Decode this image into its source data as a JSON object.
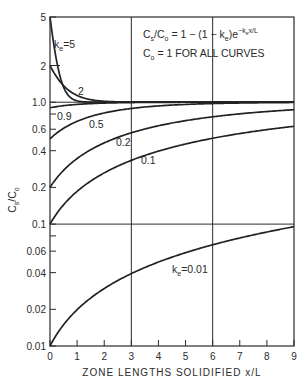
{
  "chart_data": {
    "type": "line",
    "title": "",
    "equation": "Cs/C0 = 1 - (1 - ke) e^(-ke x/L)",
    "note": "C0 = 1 FOR ALL CURVES",
    "xlabel": "ZONE LENGTHS SOLIDIFIED x/L",
    "ylabel": "Cs/C0",
    "xlim": [
      0,
      9
    ],
    "ylim": [
      0.01,
      5
    ],
    "yscale": "log",
    "x_ticks": [
      0,
      1,
      2,
      3,
      4,
      5,
      6,
      7,
      8,
      9
    ],
    "x_tick_labels": [
      "0",
      "1",
      "2",
      "3",
      "4",
      "5",
      "6",
      "7",
      "8",
      "9"
    ],
    "y_ticks": [
      5,
      2,
      1.0,
      0.8,
      0.6,
      0.4,
      0.2,
      0.1,
      0.08,
      0.06,
      0.04,
      0.02,
      0.01
    ],
    "y_tick_labels": [
      "5",
      "2",
      "1.0",
      "",
      "0.6",
      "0.4",
      "0.2",
      "0.1",
      "",
      "0.06",
      "0.04",
      "0.02",
      "0.01"
    ],
    "grid": {
      "horizontal": [
        1.0,
        0.1
      ],
      "vertical": [
        3,
        6
      ]
    },
    "legend": "inline curve labels",
    "x": [
      0,
      0.5,
      1,
      2,
      3,
      4,
      5,
      6,
      7,
      8,
      9
    ],
    "series": [
      {
        "name": "ke=5",
        "label": "ke=5",
        "ke": 5,
        "values": [
          5.0,
          1.33,
          1.03,
          1.0,
          1.0,
          1.0,
          1.0,
          1.0,
          1.0,
          1.0,
          1.0
        ]
      },
      {
        "name": "ke=2",
        "label": "2",
        "ke": 2,
        "values": [
          2.0,
          1.37,
          1.14,
          1.02,
          1.0,
          1.0,
          1.0,
          1.0,
          1.0,
          1.0,
          1.0
        ]
      },
      {
        "name": "ke=0.9",
        "label": "0.9",
        "ke": 0.9,
        "values": [
          0.9,
          0.936,
          0.959,
          0.983,
          0.993,
          0.997,
          0.999,
          1.0,
          1.0,
          1.0,
          1.0
        ]
      },
      {
        "name": "ke=0.5",
        "label": "0.5",
        "ke": 0.5,
        "values": [
          0.5,
          0.61,
          0.7,
          0.82,
          0.89,
          0.93,
          0.96,
          0.98,
          0.985,
          0.99,
          0.994
        ]
      },
      {
        "name": "ke=0.2",
        "label": "0.2",
        "ke": 0.2,
        "values": [
          0.2,
          0.276,
          0.345,
          0.46,
          0.56,
          0.64,
          0.71,
          0.76,
          0.8,
          0.84,
          0.87
        ]
      },
      {
        "name": "ke=0.1",
        "label": "0.1",
        "ke": 0.1,
        "values": [
          0.1,
          0.144,
          0.186,
          0.263,
          0.333,
          0.397,
          0.454,
          0.506,
          0.553,
          0.596,
          0.634
        ]
      },
      {
        "name": "ke=0.01",
        "label": "ke=0.01",
        "ke": 0.01,
        "values": [
          0.01,
          0.015,
          0.0199,
          0.0297,
          0.0393,
          0.0488,
          0.0582,
          0.0674,
          0.0766,
          0.0856,
          0.0945
        ]
      }
    ]
  },
  "labels": {
    "equation_lhs": "C",
    "equation_text": "Cs/Co = 1 - (1 - ke)e",
    "note": "Co = 1 FOR ALL CURVES",
    "xlabel": "ZONE LENGTHS SOLIDIFIED x/L",
    "ylabel": "Cs/Co"
  }
}
